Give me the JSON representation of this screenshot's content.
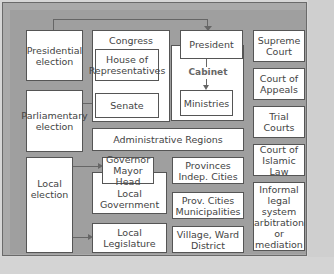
{
  "diagram": {
    "elections": {
      "presidential": "Presidential election",
      "parliamentary": "Parliamentary election",
      "local": "Local election"
    },
    "congress": {
      "label": "Congress",
      "house": "House of Representatives",
      "senate": "Senate"
    },
    "executive": {
      "president": "President",
      "cabinet": "Cabinet",
      "ministries": "Ministries"
    },
    "admin_regions": "Administrative Regions",
    "local": {
      "governor": "Governor Mayor Head",
      "local_government": "Local Government",
      "local_legislature": "Local Legislature",
      "provinces": "Provinces Indep. Cities",
      "prov_cities": "Prov. Cities Municipalities",
      "village": "Village, Ward District"
    },
    "courts": {
      "supreme": "Supreme Court",
      "appeals": "Court of Appeals",
      "trial": "Trial Courts",
      "islamic": "Court of Islamic Law",
      "informal": "Informal legal system arbitration or mediation"
    }
  }
}
